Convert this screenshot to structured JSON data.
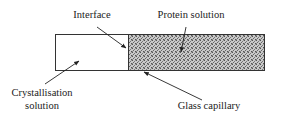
{
  "diagram": {
    "type": "capillary-crystallisation-setup",
    "labels": {
      "interface": "Interface",
      "protein_solution": "Protein solution",
      "crystallisation_line1": "Crystallisation",
      "crystallisation_line2": "solution",
      "glass_capillary": "Glass capillary"
    },
    "colors": {
      "stroke": "#333333",
      "fill_protein": "#b8b8b8",
      "fill_crystallisation": "#ffffff",
      "text": "#222222"
    }
  }
}
